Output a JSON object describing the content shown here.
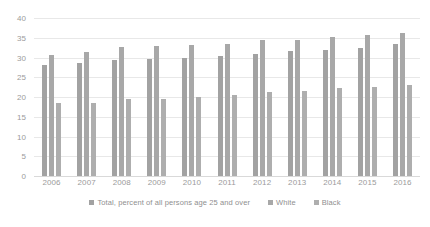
{
  "chart_data": {
    "type": "bar",
    "title": "",
    "xlabel": "",
    "ylabel": "",
    "ylim": [
      0,
      40
    ],
    "yticks": [
      "0",
      "5",
      "10",
      "15",
      "20",
      "25",
      "30",
      "35",
      "40"
    ],
    "grid": true,
    "legend_position": "bottom",
    "categories": [
      "2006",
      "2007",
      "2008",
      "2009",
      "2010",
      "2011",
      "2012",
      "2013",
      "2014",
      "2015",
      "2016"
    ],
    "series": [
      {
        "name": "Total, percent of all persons age 25 and over",
        "color": "#a2a2a2",
        "values": [
          28.0,
          28.7,
          29.4,
          29.5,
          29.9,
          30.4,
          30.9,
          31.7,
          32.0,
          32.5,
          33.4
        ]
      },
      {
        "name": "White",
        "color": "#a8a8a8",
        "values": [
          30.6,
          31.4,
          32.6,
          32.8,
          33.2,
          33.3,
          34.5,
          34.5,
          35.2,
          35.6,
          36.2
        ]
      },
      {
        "name": "Black",
        "color": "#aeaeae",
        "values": [
          18.5,
          18.6,
          19.6,
          19.4,
          19.9,
          20.5,
          21.2,
          21.4,
          22.4,
          22.5,
          23.0
        ]
      }
    ]
  },
  "colors": {
    "gridline": "#e8e8e8",
    "axis_text": "#9b9b9b",
    "legend_text": "#8f8f8f",
    "background": "#ffffff"
  }
}
